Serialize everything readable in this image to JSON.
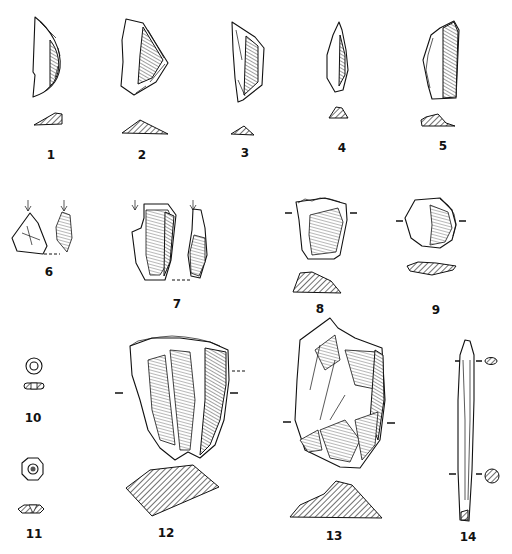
{
  "figure": {
    "type": "archaeological-artifact-plate",
    "background": "#ffffff",
    "ink": "#111111",
    "artifacts": [
      {
        "id": 1,
        "label": "1",
        "kind": "backed blade segment (lunate)",
        "has_section": true
      },
      {
        "id": 2,
        "label": "2",
        "kind": "retouched flake",
        "has_section": true
      },
      {
        "id": 3,
        "label": "3",
        "kind": "backed bladelet",
        "has_section": true
      },
      {
        "id": 4,
        "label": "4",
        "kind": "pointed bladelet",
        "has_section": true
      },
      {
        "id": 5,
        "label": "5",
        "kind": "backed blade",
        "has_section": true
      },
      {
        "id": 6,
        "label": "6",
        "kind": "burin (two views)",
        "has_section": false
      },
      {
        "id": 7,
        "label": "7",
        "kind": "burin (two views)",
        "has_section": false
      },
      {
        "id": 8,
        "label": "8",
        "kind": "endscraper",
        "has_section": true
      },
      {
        "id": 9,
        "label": "9",
        "kind": "circular scraper",
        "has_section": true
      },
      {
        "id": 10,
        "label": "10",
        "kind": "disc bead",
        "has_section": true
      },
      {
        "id": 11,
        "label": "11",
        "kind": "faceted bead",
        "has_section": true
      },
      {
        "id": 12,
        "label": "12",
        "kind": "scraper on flake",
        "has_section": true
      },
      {
        "id": 13,
        "label": "13",
        "kind": "core / flake tool",
        "has_section": true
      },
      {
        "id": 14,
        "label": "14",
        "kind": "bone point / awl",
        "has_section": true
      }
    ]
  }
}
